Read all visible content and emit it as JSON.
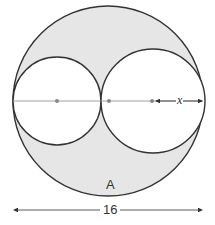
{
  "diagram": {
    "labels": {
      "region": "A",
      "diameter": "16",
      "radius_variable": "x"
    },
    "colors": {
      "shaded_region": "#e6e6e6",
      "circle_stroke": "#333333",
      "guide_line": "#888888",
      "background": "#ffffff"
    },
    "shapes": {
      "outer_circle": {
        "cx": 108,
        "cy": 101,
        "r": 95
      },
      "left_circle": {
        "cx": 57,
        "cy": 101,
        "r": 44
      },
      "right_circle": {
        "cx": 153,
        "cy": 101,
        "r": 52
      },
      "center_dots": [
        57,
        109,
        152
      ]
    }
  }
}
